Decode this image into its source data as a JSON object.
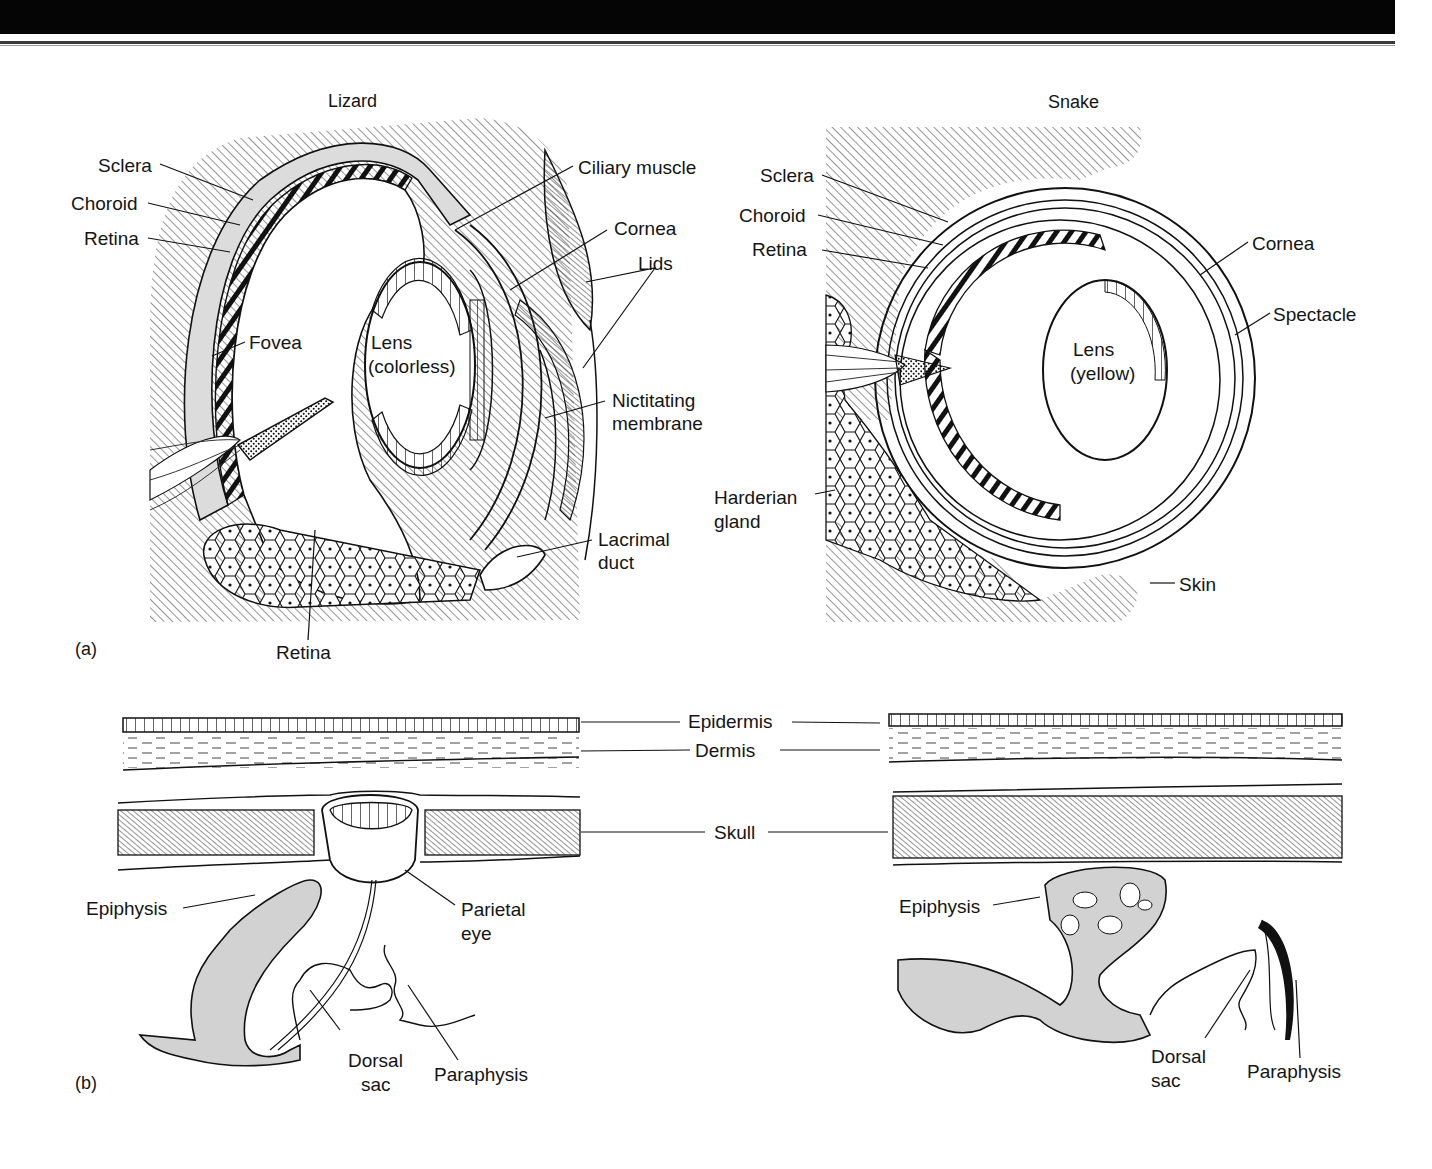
{
  "header": {
    "bar_color": "#050505",
    "rule_color": "#3a3a3a"
  },
  "figure_a": {
    "panel_label": "(a)",
    "lizard": {
      "title": "Lizard",
      "labels": {
        "sclera": "Sclera",
        "choroid": "Choroid",
        "retina_top": "Retina",
        "fovea": "Fovea",
        "lens_line1": "Lens",
        "lens_line2": "(colorless)",
        "ciliary_muscle": "Ciliary muscle",
        "cornea": "Cornea",
        "lids": "Lids",
        "nictitating_line1": "Nictitating",
        "nictitating_line2": "membrane",
        "lacrimal_line1": "Lacrimal",
        "lacrimal_line2": "duct",
        "retina_bottom": "Retina"
      }
    },
    "snake": {
      "title": "Snake",
      "labels": {
        "sclera": "Sclera",
        "choroid": "Choroid",
        "retina": "Retina",
        "cornea": "Cornea",
        "spectacle": "Spectacle",
        "lens_line1": "Lens",
        "lens_line2": "(yellow)",
        "harderian_line1": "Harderian",
        "harderian_line2": "gland",
        "skin": "Skin"
      }
    }
  },
  "figure_b": {
    "panel_label": "(b)",
    "shared_labels": {
      "epidermis": "Epidermis",
      "dermis": "Dermis",
      "skull": "Skull"
    },
    "lizard": {
      "epiphysis": "Epiphysis",
      "parietal_line1": "Parietal",
      "parietal_line2": "eye",
      "dorsal_line1": "Dorsal",
      "dorsal_line2": "sac",
      "paraphysis": "Paraphysis"
    },
    "snake": {
      "epiphysis": "Epiphysis",
      "dorsal_line1": "Dorsal",
      "dorsal_line2": "sac",
      "paraphysis": "Paraphysis"
    }
  },
  "colors": {
    "ink": "#141414",
    "hatch": "#3c3c3c",
    "gray_fill": "#d2d2d2",
    "sclera_fill": "#dcdcdc"
  }
}
